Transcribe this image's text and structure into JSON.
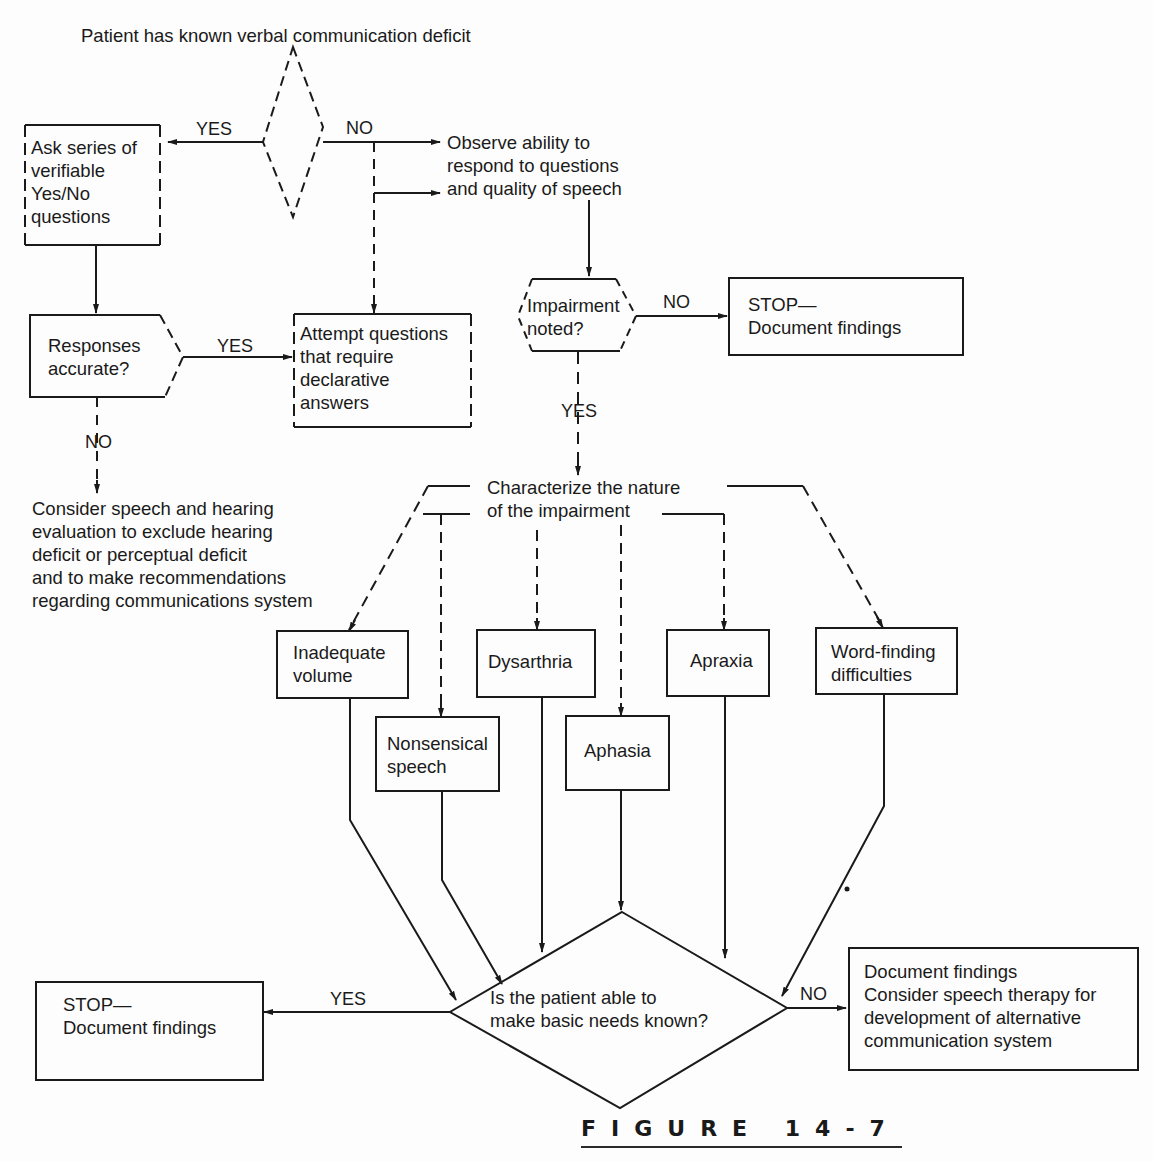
{
  "figure": {
    "label": "FIGURE 14-7",
    "caption_visible": "(caption text cut off at bottom edge)"
  },
  "colors": {
    "ink": "#1a1a1a",
    "background": "#fdfdfd"
  },
  "nodes": {
    "start": "Patient has known verbal communication deficit",
    "ask_yes_no": "Ask series of\nverifiable\nYes/No\nquestions",
    "observe": "Observe ability to\nrespond to questions\nand quality of speech",
    "responses_accurate": "Responses\naccurate?",
    "attempt_declarative": "Attempt questions\nthat require\ndeclarative\nanswers",
    "impairment_noted": "Impairment\nnoted?",
    "stop_top": "STOP—\nDocument findings",
    "consider_eval": "Consider speech and hearing\nevaluation to exclude hearing\ndeficit or perceptual deficit\nand to make recommendations\nregarding communications system",
    "characterize": "Characterize the nature\nof the impairment",
    "inadequate_volume": "Inadequate\nvolume",
    "dysarthria": "Dysarthria",
    "apraxia": "Apraxia",
    "word_finding": "Word-finding\ndifficulties",
    "nonsensical": "Nonsensical\nspeech",
    "aphasia": "Aphasia",
    "basic_needs": "Is the patient able to\nmake basic needs known?",
    "stop_bottom": "STOP—\nDocument findings",
    "document_consider": "Document findings\nConsider speech therapy for\ndevelopment of alternative\ncommunication system"
  },
  "edge_labels": {
    "start_yes": "YES",
    "start_no": "NO",
    "responses_yes": "YES",
    "responses_no": "NO",
    "impairment_no": "NO",
    "impairment_yes": "YES",
    "needs_yes": "YES",
    "needs_no": "NO"
  }
}
